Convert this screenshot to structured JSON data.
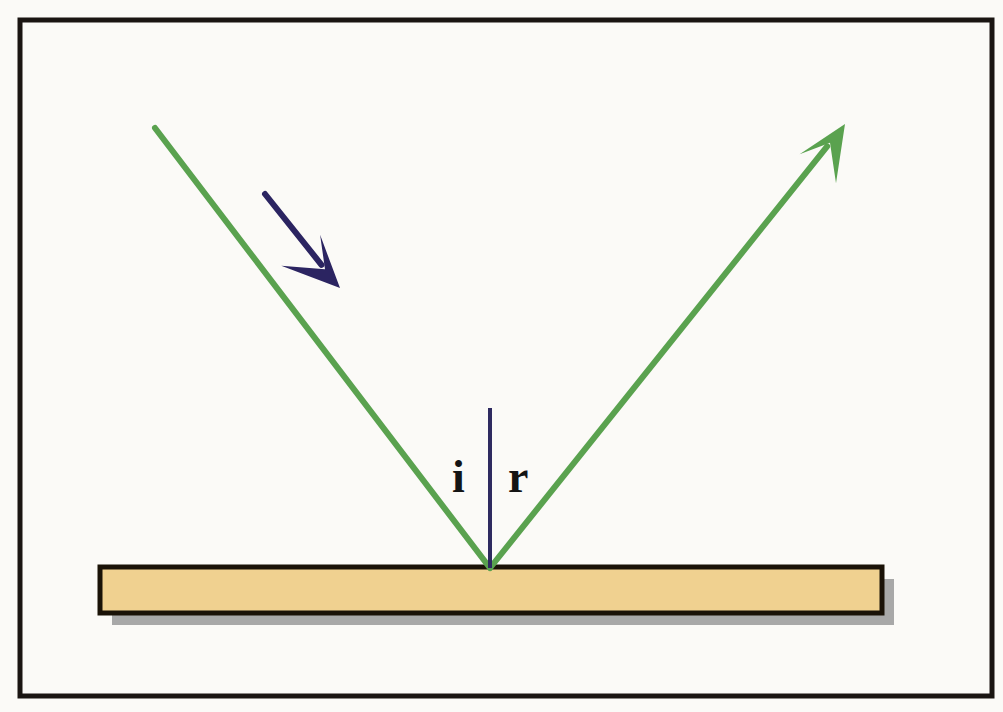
{
  "figure": {
    "background_color": "#fbfaf7",
    "frame": {
      "name": "figure-border",
      "color": "#1a1512",
      "x": 20,
      "y": 20,
      "width": 972,
      "height": 676,
      "stroke_width": 5
    }
  },
  "labels": {
    "angle_of_incidence": "i",
    "angle_of_reflection": "r"
  },
  "colors": {
    "ray_green": "#5aa24f",
    "normal_navy": "#2e2a60",
    "arrow_navy": "#2b2461",
    "mirror_fill": "#f0d190",
    "mirror_border": "#1a1207",
    "mirror_shadow": "#a8a8a8",
    "label_text": "#141414"
  },
  "elements": {
    "incident_ray": {
      "name": "incident-ray",
      "color": "#5aa24f",
      "x1": 155,
      "y1": 128,
      "x2": 490,
      "y2": 568,
      "stroke_width": 6
    },
    "reflected_ray": {
      "name": "reflected-ray",
      "color": "#5aa24f",
      "x1": 490,
      "y1": 568,
      "x2": 845,
      "y2": 124,
      "stroke_width": 6,
      "arrowhead": "barbed-arrow-tip"
    },
    "normal_line": {
      "name": "normal-line",
      "color": "#2e2a60",
      "x1": 490,
      "y1": 408,
      "x2": 490,
      "y2": 568,
      "stroke_width": 4
    },
    "direction_arrow": {
      "name": "direction-arrow",
      "color": "#2b2461",
      "x1": 265,
      "y1": 194,
      "x2": 340,
      "y2": 288,
      "stroke_width": 6,
      "arrowhead": "barbed-arrow-tip"
    },
    "mirror": {
      "name": "mirror-surface",
      "fill": "#f0d190",
      "border": "#1a1207",
      "x": 100,
      "y": 567,
      "width": 782,
      "height": 46,
      "stroke_width": 5
    },
    "mirror_shadow": {
      "name": "mirror-shadow",
      "fill": "#a8a8a8",
      "x": 112,
      "y": 579,
      "width": 782,
      "height": 46
    },
    "label_i": {
      "name": "label-angle-of-incidence",
      "x": 452,
      "y": 492
    },
    "label_r": {
      "name": "label-angle-of-reflection",
      "x": 508,
      "y": 492
    }
  }
}
